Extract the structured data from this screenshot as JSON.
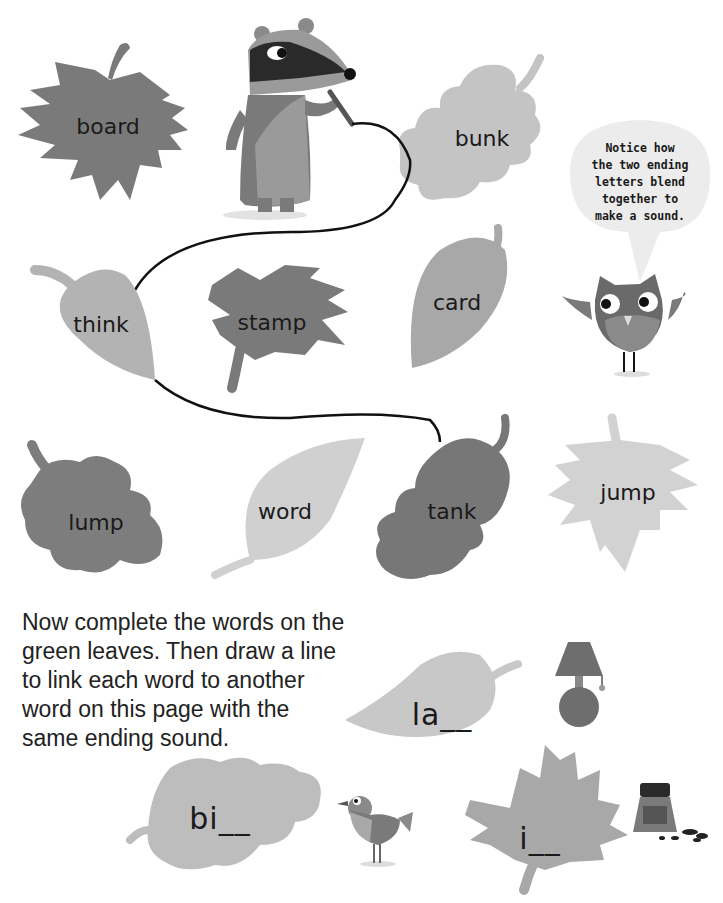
{
  "page": {
    "top_cut_text": "... y ... p ...",
    "speech_bubble": {
      "lines": [
        "Notice how",
        "the two ending",
        "letters blend",
        "together to",
        "make a sound."
      ]
    },
    "leaves": [
      {
        "id": "board",
        "word": "board",
        "shade": "#7a7a7a"
      },
      {
        "id": "bunk",
        "word": "bunk",
        "shade": "#c4c4c4"
      },
      {
        "id": "think",
        "word": "think",
        "shade": "#b3b3b3"
      },
      {
        "id": "stamp",
        "word": "stamp",
        "shade": "#7a7a7a"
      },
      {
        "id": "card",
        "word": "card",
        "shade": "#a8a8a8"
      },
      {
        "id": "lump",
        "word": "lump",
        "shade": "#7d7d7d"
      },
      {
        "id": "word",
        "word": "word",
        "shade": "#d0d0d0"
      },
      {
        "id": "tank",
        "word": "tank",
        "shade": "#777777"
      },
      {
        "id": "jump",
        "word": "jump",
        "shade": "#d2d2d2"
      }
    ],
    "instructions": {
      "lines": [
        "Now complete the words on the",
        "green leaves. Then draw a line",
        "to link each word to another",
        "word on this page with the",
        "same ending sound."
      ]
    },
    "exercise_leaves": [
      {
        "id": "lamp",
        "text": "la__",
        "picture": "lamp"
      },
      {
        "id": "bird",
        "text": "bi__",
        "picture": "bird"
      },
      {
        "id": "ink",
        "text": "i__",
        "picture": "ink-bottle"
      }
    ],
    "colors": {
      "dark_leaf": "#7a7a7a",
      "light_leaf": "#c8c8c8",
      "mid_leaf": "#aaaaaa",
      "line": "#111111",
      "bubble": "#ececec"
    }
  }
}
